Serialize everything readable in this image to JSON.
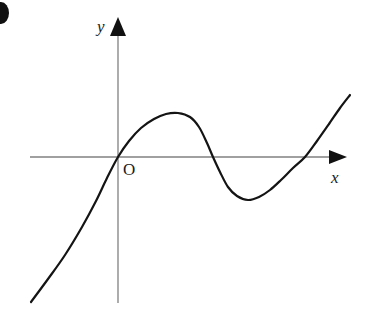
{
  "figure": {
    "background_color": "#ffffff",
    "width": 369,
    "height": 315,
    "corner_mark": {
      "name": "partial-bullet-glyph",
      "color": "#101010",
      "description": "dark rounded glyph cropped at the left edge"
    }
  },
  "axes": {
    "color": "#808080",
    "stroke_width": 1.3,
    "arrowhead_color": "#111111",
    "x_axis": {
      "label": "x",
      "y_pixel": 157,
      "x_start": 30,
      "x_end": 347
    },
    "y_axis": {
      "label": "y",
      "x_pixel": 118,
      "y_start": 303,
      "y_end": 17
    },
    "origin_label": "O"
  },
  "chart_data": {
    "type": "line",
    "title": "",
    "xlabel": "x",
    "ylabel": "y",
    "grid": false,
    "legend": null,
    "annotations": [
      "O"
    ],
    "curve_color": "#141414",
    "curve_width": 2.2,
    "axis_crossings_pixel_x": [
      118,
      213,
      305
    ],
    "local_maximum_pixel": [
      178,
      113
    ],
    "local_minimum_pixel": [
      248,
      200
    ],
    "endpoints_pixel": [
      [
        31,
        302
      ],
      [
        350,
        95
      ]
    ],
    "points_pixel": [
      [
        31,
        302
      ],
      [
        48,
        279
      ],
      [
        65,
        255
      ],
      [
        82,
        227
      ],
      [
        96,
        201
      ],
      [
        107,
        178
      ],
      [
        118,
        157
      ],
      [
        129,
        141
      ],
      [
        141,
        128
      ],
      [
        154,
        119
      ],
      [
        166,
        114
      ],
      [
        178,
        113
      ],
      [
        190,
        117
      ],
      [
        199,
        127
      ],
      [
        207,
        143
      ],
      [
        213,
        157
      ],
      [
        220,
        172
      ],
      [
        228,
        187
      ],
      [
        237,
        196
      ],
      [
        248,
        200
      ],
      [
        259,
        197
      ],
      [
        270,
        190
      ],
      [
        281,
        180
      ],
      [
        293,
        168
      ],
      [
        305,
        157
      ],
      [
        317,
        141
      ],
      [
        329,
        124
      ],
      [
        340,
        108
      ],
      [
        350,
        95
      ]
    ]
  }
}
